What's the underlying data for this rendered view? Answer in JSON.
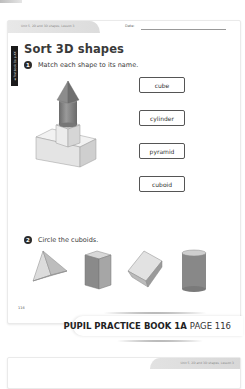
{
  "page": {
    "unit_header": "Unit 5, 2D and 3D shapes, Lesson 3",
    "date_label": "Date:",
    "side_tab": "◄ Textbook 1a p.XX",
    "title": "Sort 3D shapes",
    "page_number": "116"
  },
  "question1": {
    "number": "1",
    "text": "Match each shape to its name.",
    "labels": [
      "cube",
      "cylinder",
      "pyramid",
      "cuboid"
    ],
    "figure": "tower-of-stacked-3d-shapes"
  },
  "question2": {
    "number": "2",
    "text": "Circle the cuboids.",
    "shapes": [
      "pyramid-icon",
      "cuboid-icon",
      "cube-icon",
      "cylinder-icon"
    ]
  },
  "banner": {
    "book": "PUPIL PRACTICE BOOK 1A",
    "page": "PAGE 116"
  },
  "next_page": {
    "unit_header": "Unit 5, 2D and 3D shapes, Lesson 3"
  }
}
